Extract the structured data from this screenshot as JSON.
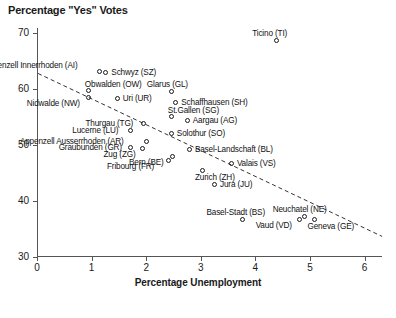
{
  "chart_data": {
    "type": "scatter",
    "title": "Percentage \"Yes\" Votes",
    "xlabel": "Percentage Unemployment",
    "ylabel": "",
    "xlim": [
      0,
      6.3
    ],
    "ylim": [
      30,
      72
    ],
    "grid": false,
    "legend": "none",
    "x_ticks": [
      "0",
      "1",
      "2",
      "3",
      "4",
      "5",
      "6"
    ],
    "y_ticks": [
      "30",
      "40",
      "50",
      "60",
      "70"
    ],
    "points": [
      {
        "label": "Ticino (TI)",
        "x": 4.4,
        "y": 68.7,
        "label_pos": "above"
      },
      {
        "label": "Appenzell Innerrhoden (AI)",
        "x": 1.15,
        "y": 63.0,
        "label_pos": "above-left"
      },
      {
        "label": "Schwyz (SZ)",
        "x": 1.27,
        "y": 62.8,
        "label_pos": "right"
      },
      {
        "label": "Obwalden (OW)",
        "x": 0.95,
        "y": 59.6,
        "label_pos": "above-right"
      },
      {
        "label": "Nidwalde (NW)",
        "x": 0.95,
        "y": 58.4,
        "label_pos": "below-left"
      },
      {
        "label": "Uri (UR)",
        "x": 1.48,
        "y": 58.2,
        "label_pos": "right"
      },
      {
        "label": "Glarus (GL)",
        "x": 2.47,
        "y": 59.5,
        "label_pos": "above"
      },
      {
        "label": "Schaffhausen (SH)",
        "x": 2.55,
        "y": 57.5,
        "label_pos": "right"
      },
      {
        "label": "St.Gallen (SG)",
        "x": 2.47,
        "y": 55.0,
        "label_pos": "above-right"
      },
      {
        "label": "Aargau (AG)",
        "x": 2.76,
        "y": 54.2,
        "label_pos": "right"
      },
      {
        "label": "Solothur (SO)",
        "x": 2.47,
        "y": 51.9,
        "label_pos": "right"
      },
      {
        "label": "Thurgau (TG)",
        "x": 1.96,
        "y": 53.8,
        "label_pos": "left"
      },
      {
        "label": "Lucerne (LU)",
        "x": 1.72,
        "y": 52.5,
        "label_pos": "left"
      },
      {
        "label": "Appenzell Ausserrhoden (AR)",
        "x": 2.01,
        "y": 50.5,
        "label_pos": "left"
      },
      {
        "label": "Graubunden (GR)",
        "x": 1.72,
        "y": 49.4,
        "label_pos": "left"
      },
      {
        "label": "Zug (ZG)",
        "x": 1.94,
        "y": 49.2,
        "label_pos": "below-left"
      },
      {
        "label": "Bern (BE)",
        "x": 2.49,
        "y": 47.8,
        "label_pos": "below-left"
      },
      {
        "label": "Fribourg (FR)",
        "x": 2.42,
        "y": 47.2,
        "label_pos": "below-left"
      },
      {
        "label": "Basel-Landschaft (BL)",
        "x": 2.8,
        "y": 49.1,
        "label_pos": "right"
      },
      {
        "label": "Valais (VS)",
        "x": 3.57,
        "y": 46.6,
        "label_pos": "right"
      },
      {
        "label": "Zurich (ZH)",
        "x": 3.04,
        "y": 45.4,
        "label_pos": "below-right"
      },
      {
        "label": "Jura (JU)",
        "x": 3.26,
        "y": 42.9,
        "label_pos": "right"
      },
      {
        "label": "Basel-Stadt (BS)",
        "x": 3.77,
        "y": 36.6,
        "label_pos": "above"
      },
      {
        "label": "Vaud (VD)",
        "x": 4.81,
        "y": 36.6,
        "label_pos": "below-left"
      },
      {
        "label": "Neuchatel (NE)",
        "x": 4.9,
        "y": 37.0,
        "label_pos": "above"
      },
      {
        "label": "Geneva (GE)",
        "x": 5.1,
        "y": 36.6,
        "label_pos": "below-right"
      }
    ],
    "trend_line": {
      "style": "dashed",
      "x_start": 0.02,
      "y_start": 62.8,
      "x_end": 6.32,
      "y_end": 33.6
    },
    "colors": {
      "marker_stroke": "#1a1a1a",
      "axis": "#555555",
      "text": "#111111",
      "trend": "#333333",
      "background": "#ffffff"
    }
  }
}
